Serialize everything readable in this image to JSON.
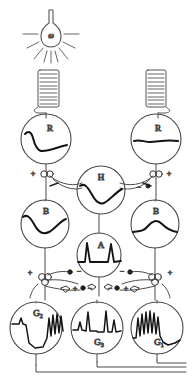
{
  "figure": {
    "type": "neural-circuit-diagram",
    "background_color": "#ffffff",
    "line_color": "#3a3a3a",
    "trace_color": "#111111"
  },
  "light_source": {
    "name": "light-bulb",
    "label": "ω",
    "ray_count": 8
  },
  "resistors": [
    {
      "name": "resistor-left",
      "coil_turns": 9
    },
    {
      "name": "resistor-right",
      "coil_turns": 9
    }
  ],
  "cells": [
    {
      "id": "R-left",
      "label": "R",
      "sub": "",
      "trace": "receptor-hyperpolarizing"
    },
    {
      "id": "R-right",
      "label": "R",
      "sub": "",
      "trace": "receptor-flat"
    },
    {
      "id": "H",
      "label": "H",
      "sub": "",
      "trace": "horizontal-dip"
    },
    {
      "id": "B-left",
      "label": "B",
      "sub": "",
      "trace": "bipolar-dip"
    },
    {
      "id": "B-right",
      "label": "B",
      "sub": "",
      "trace": "bipolar-hump"
    },
    {
      "id": "A",
      "label": "A",
      "sub": "",
      "trace": "amacrine-spikes"
    },
    {
      "id": "G2",
      "label": "G",
      "sub": "2",
      "trace": "ganglion-off-burst"
    },
    {
      "id": "G3",
      "label": "G",
      "sub": "3",
      "trace": "ganglion-onoff-burst"
    },
    {
      "id": "G1",
      "label": "G",
      "sub": "1",
      "trace": "ganglion-on-burst"
    }
  ],
  "synapses": [
    {
      "id": "syn-r-left",
      "sign": "+",
      "position": "left-receptor-output"
    },
    {
      "id": "syn-r-right",
      "sign": "+",
      "position": "right-receptor-output"
    },
    {
      "id": "syn-h-left",
      "sign": "−",
      "position": "horizontal-to-left"
    },
    {
      "id": "syn-h-right",
      "sign": "−",
      "position": "horizontal-to-right"
    },
    {
      "id": "syn-b-left",
      "sign": "+",
      "position": "left-bipolar-output"
    },
    {
      "id": "syn-b-right",
      "sign": "+",
      "position": "right-bipolar-output"
    },
    {
      "id": "syn-a-l-in",
      "sign": "−",
      "position": "amacrine-left-in"
    },
    {
      "id": "syn-a-l-out",
      "sign": "+",
      "position": "amacrine-left-out"
    },
    {
      "id": "syn-a-r-in",
      "sign": "−",
      "position": "amacrine-right-in"
    },
    {
      "id": "syn-a-r-out",
      "sign": "+",
      "position": "amacrine-right-out"
    },
    {
      "id": "syn-g-left",
      "sign": "+",
      "position": "left-ganglion-in"
    },
    {
      "id": "syn-g-right",
      "sign": "+",
      "position": "right-ganglion-in"
    }
  ],
  "signs": {
    "plus": "+",
    "minus": "−"
  },
  "labels": {
    "omega": "ω",
    "R": "R",
    "H": "H",
    "B": "B",
    "A": "A",
    "G": "G",
    "g1": "1",
    "g2": "2",
    "g3": "3"
  },
  "caption": {
    "text": ""
  }
}
